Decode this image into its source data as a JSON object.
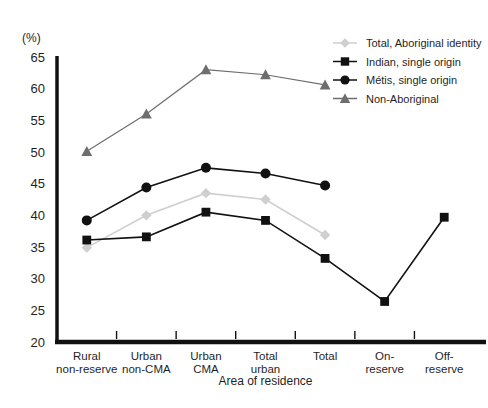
{
  "chart_data": {
    "type": "line",
    "title": "",
    "unit_label": "(%)",
    "xlabel": "Area of residence",
    "ylabel": "",
    "ylim": [
      20,
      65
    ],
    "ytick_step": 5,
    "yticks": [
      20,
      25,
      30,
      35,
      40,
      45,
      50,
      55,
      60,
      65
    ],
    "grid": false,
    "legend_position": "top-right",
    "categories": [
      "Rural non-reserve",
      "Urban non-CMA",
      "Urban CMA",
      "Total urban",
      "Total",
      "On-reserve",
      "Off-reserve"
    ],
    "categories_lines": [
      [
        "Rural",
        "non-reserve"
      ],
      [
        "Urban",
        "non-CMA"
      ],
      [
        "Urban",
        "CMA"
      ],
      [
        "Total",
        "urban"
      ],
      [
        "Total",
        ""
      ],
      [
        "On-",
        "reserve"
      ],
      [
        "Off-",
        "reserve"
      ]
    ],
    "series": [
      {
        "name": "Total, Aboriginal identity",
        "marker": "diamond",
        "color": "#cfcfcf",
        "values": [
          34.9,
          40.0,
          43.5,
          42.5,
          36.9,
          null,
          null
        ]
      },
      {
        "name": "Indian, single origin",
        "marker": "square",
        "color": "#111111",
        "values": [
          36.1,
          36.6,
          40.5,
          39.2,
          33.2,
          26.4,
          39.7
        ]
      },
      {
        "name": "Métis, single origin",
        "marker": "circle",
        "color": "#111111",
        "values": [
          39.2,
          44.4,
          47.5,
          46.6,
          44.7,
          null,
          null
        ]
      },
      {
        "name": "Non-Aboriginal",
        "marker": "triangle",
        "color": "#6e6e6e",
        "values": [
          50.1,
          56.0,
          63.0,
          62.2,
          60.6,
          null,
          null
        ]
      }
    ]
  },
  "legend": {
    "items": [
      {
        "label": "Total, Aboriginal identity"
      },
      {
        "label": "Indian, single origin"
      },
      {
        "label": "Métis, single origin"
      },
      {
        "label": "Non-Aboriginal"
      }
    ]
  }
}
